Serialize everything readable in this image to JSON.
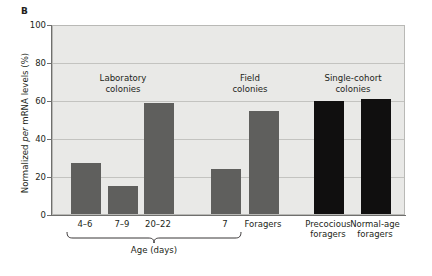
{
  "panel": {
    "letter": "B"
  },
  "chart_data": {
    "type": "bar",
    "title": "",
    "xlabel": "Age (days)",
    "ylabel": "Normalized per mRNA levels (%)",
    "ylabel_prefix": "Normalized ",
    "ylabel_italic": "per",
    "ylabel_suffix": " mRNA levels (%)",
    "ylim": [
      0,
      100
    ],
    "yticks": [
      100,
      80,
      60,
      40,
      20,
      0
    ],
    "ytick_labels": [
      "100",
      "80",
      "60",
      "40",
      "20",
      "0"
    ],
    "grid": true,
    "legend": "none",
    "categories": [
      "4–6",
      "7–9",
      "20–22",
      "7",
      "Foragers",
      "Precocious foragers",
      "Normal-age foragers"
    ],
    "values": [
      27,
      15,
      59,
      24,
      55,
      60,
      61
    ],
    "colors": [
      "#5f5f5d",
      "#5f5f5d",
      "#5f5f5d",
      "#5f5f5d",
      "#5f5f5d",
      "#100f0f",
      "#100f0f"
    ],
    "bars": [
      {
        "label": "4–6",
        "label_line2": "",
        "value": 27,
        "color": "#5f5f5d",
        "x": 70,
        "width": 30
      },
      {
        "label": "7–9",
        "label_line2": "",
        "value": 15,
        "color": "#5f5f5d",
        "x": 107,
        "width": 30
      },
      {
        "label": "20–22",
        "label_line2": "",
        "value": 59,
        "color": "#5f5f5d",
        "x": 143,
        "width": 30
      },
      {
        "label": "7",
        "label_line2": "",
        "value": 24,
        "color": "#5f5f5d",
        "x": 210,
        "width": 30
      },
      {
        "label": "Foragers",
        "label_line2": "",
        "value": 55,
        "color": "#5f5f5d",
        "x": 248,
        "width": 30
      },
      {
        "label": "Precocious",
        "label_line2": "foragers",
        "value": 60,
        "color": "#100f0f",
        "x": 313,
        "width": 30
      },
      {
        "label": "Normal-age",
        "label_line2": "foragers",
        "value": 61,
        "color": "#100f0f",
        "x": 360,
        "width": 30
      }
    ],
    "groups": [
      {
        "line1": "Laboratory",
        "line2": "colonies",
        "center": 122,
        "top": 72
      },
      {
        "line1": "Field",
        "line2": "colonies",
        "center": 249,
        "top": 72
      },
      {
        "line1": "Single-cohort",
        "line2": "colonies",
        "center": 352,
        "top": 72
      }
    ],
    "brace": {
      "label": "Age (days)",
      "start": 66,
      "end": 242
    },
    "plot_bg": "#e9e9e7",
    "grid_color": "#c3c3c0",
    "axis_color": "#6f6f6d",
    "bar_gray": "#5f5f5d",
    "bar_black": "#100f0f"
  }
}
